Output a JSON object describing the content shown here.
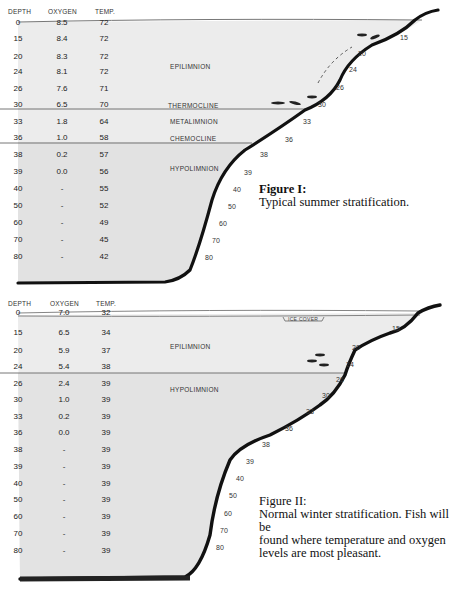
{
  "figures": [
    {
      "id": "fig1",
      "caption_title": "Figure I:",
      "caption_text": "Typical summer stratification.",
      "headers": {
        "depth": "DEPTH",
        "oxygen": "OXYGEN",
        "temp": "TEMP."
      },
      "rows": [
        {
          "depth": "0",
          "oxygen": "8.5",
          "temp": "72"
        },
        {
          "depth": "15",
          "oxygen": "8.4",
          "temp": "72"
        },
        {
          "depth": "20",
          "oxygen": "8.3",
          "temp": "72"
        },
        {
          "depth": "24",
          "oxygen": "8.1",
          "temp": "72"
        },
        {
          "depth": "26",
          "oxygen": "7.6",
          "temp": "71"
        },
        {
          "depth": "30",
          "oxygen": "6.5",
          "temp": "70"
        },
        {
          "depth": "33",
          "oxygen": "1.8",
          "temp": "64"
        },
        {
          "depth": "36",
          "oxygen": "1.0",
          "temp": "58"
        },
        {
          "depth": "38",
          "oxygen": "0.2",
          "temp": "57"
        },
        {
          "depth": "39",
          "oxygen": "0.0",
          "temp": "56"
        },
        {
          "depth": "40",
          "oxygen": "-",
          "temp": "55"
        },
        {
          "depth": "50",
          "oxygen": "-",
          "temp": "52"
        },
        {
          "depth": "60",
          "oxygen": "-",
          "temp": "49"
        },
        {
          "depth": "70",
          "oxygen": "-",
          "temp": "45"
        },
        {
          "depth": "80",
          "oxygen": "-",
          "temp": "42"
        }
      ],
      "zones": {
        "epilimnion": "EPILIMNION",
        "thermocline": "THERMOCLINE",
        "metalimnion": "METALIMNION",
        "chemocline": "CHEMOCLINE",
        "hypolimnion": "HYPOLIMNION"
      },
      "shore_depth_labels": [
        "15",
        "20",
        "24",
        "26",
        "30",
        "33",
        "36",
        "38",
        "39",
        "40",
        "50",
        "60",
        "70",
        "80"
      ]
    },
    {
      "id": "fig2",
      "caption_title": "Figure II:",
      "caption_text": "Normal winter stratification. Fish will be found where temperature and oxygen levels are most pleasant.",
      "caption_lines": [
        "Normal winter stratification. Fish will be",
        "found where temperature and oxygen",
        "levels are most pleasant."
      ],
      "headers": {
        "depth": "DEPTH",
        "oxygen": "OXYGEN",
        "temp": "TEMP."
      },
      "rows": [
        {
          "depth": "0",
          "oxygen": "7.0",
          "temp": "32"
        },
        {
          "depth": "15",
          "oxygen": "6.5",
          "temp": "34"
        },
        {
          "depth": "20",
          "oxygen": "5.9",
          "temp": "37"
        },
        {
          "depth": "24",
          "oxygen": "5.4",
          "temp": "38"
        },
        {
          "depth": "26",
          "oxygen": "2.4",
          "temp": "39"
        },
        {
          "depth": "30",
          "oxygen": "1.0",
          "temp": "39"
        },
        {
          "depth": "33",
          "oxygen": "0.2",
          "temp": "39"
        },
        {
          "depth": "36",
          "oxygen": "0.0",
          "temp": "39"
        },
        {
          "depth": "38",
          "oxygen": "-",
          "temp": "39"
        },
        {
          "depth": "39",
          "oxygen": "-",
          "temp": "39"
        },
        {
          "depth": "40",
          "oxygen": "-",
          "temp": "39"
        },
        {
          "depth": "50",
          "oxygen": "-",
          "temp": "39"
        },
        {
          "depth": "60",
          "oxygen": "-",
          "temp": "39"
        },
        {
          "depth": "70",
          "oxygen": "-",
          "temp": "39"
        },
        {
          "depth": "80",
          "oxygen": "-",
          "temp": "39"
        }
      ],
      "zones": {
        "epilimnion": "EPILIMNION",
        "hypolimnion": "HYPOLIMNION",
        "ice_cover": "ICE COVER"
      },
      "shore_depth_labels": [
        "15",
        "20",
        "24",
        "26",
        "30",
        "33",
        "36",
        "38",
        "39",
        "40",
        "50",
        "60",
        "70",
        "80"
      ]
    }
  ]
}
